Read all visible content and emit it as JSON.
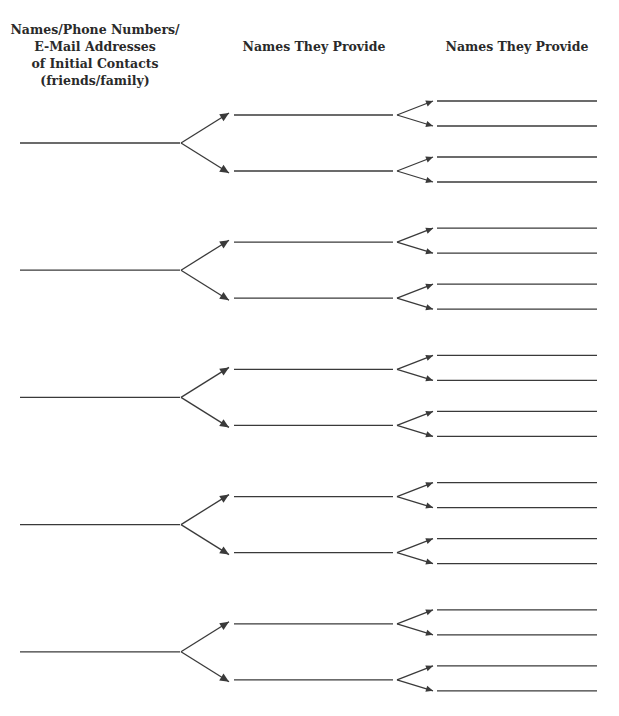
{
  "headers": {
    "initial_contacts": [
      "Names/Phone Numbers/",
      "E-Mail Addresses",
      "of Initial Contacts",
      "(friends/family)"
    ],
    "names_provided_1": "Names They Provide",
    "names_provided_2": "Names They Provide"
  },
  "form": {
    "groups": 5,
    "branches_per_contact": 2,
    "sub_branches_per_name": 2,
    "line_color": "#3a3a3a"
  }
}
